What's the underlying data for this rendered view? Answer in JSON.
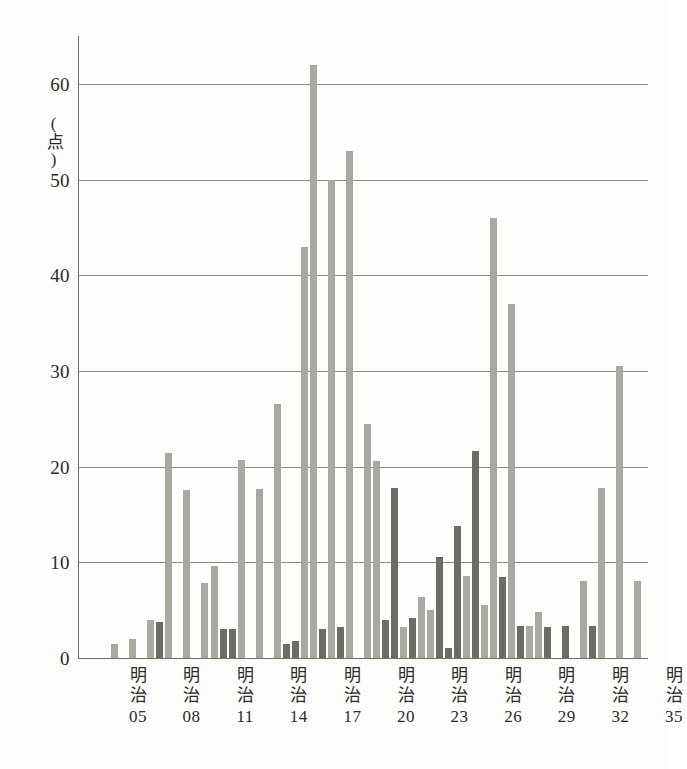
{
  "chart_data": {
    "type": "bar",
    "title": "",
    "subtitle": "",
    "xlabel": "",
    "ylabel": "",
    "yunit": "(点)",
    "ylim": [
      0,
      62
    ],
    "grid": true,
    "gridlines": [
      10,
      20,
      30,
      40,
      50,
      60
    ],
    "legend_position": "none",
    "colors": {
      "light": "#a9a9a2",
      "dark": "#6d6d66",
      "axis": "#6f6f68",
      "grid": "#8d8d85"
    },
    "y_ticks": [
      "0",
      "10",
      "20",
      "30",
      "40",
      "50",
      "60"
    ],
    "y_tick_values": [
      0,
      10,
      20,
      30,
      40,
      50,
      60
    ],
    "x_tick_labels": [
      {
        "era": "明治",
        "year": "05"
      },
      {
        "era": "明治",
        "year": "08"
      },
      {
        "era": "明治",
        "year": "11"
      },
      {
        "era": "明治",
        "year": "14"
      },
      {
        "era": "明治",
        "year": "17"
      },
      {
        "era": "明治",
        "year": "20"
      },
      {
        "era": "明治",
        "year": "23"
      },
      {
        "era": "明治",
        "year": "26"
      },
      {
        "era": "明治",
        "year": "29"
      },
      {
        "era": "明治",
        "year": "32"
      },
      {
        "era": "明治",
        "year": "35"
      }
    ],
    "x_tick_year_numbers": [
      5,
      8,
      11,
      14,
      17,
      20,
      23,
      26,
      29,
      32,
      35
    ],
    "categories": [
      "明治03",
      "明治04",
      "明治05",
      "明治06",
      "明治07",
      "明治08",
      "明治09",
      "明治10",
      "明治11",
      "明治12",
      "明治13",
      "明治14",
      "明治15",
      "明治16",
      "明治17",
      "明治18",
      "明治19",
      "明治20",
      "明治21",
      "明治22",
      "明治23",
      "明治24",
      "明治25",
      "明治26",
      "明治27",
      "明治28",
      "明治29",
      "明治30",
      "明治31",
      "明治32",
      "明治33",
      "明治34",
      "明治35",
      "明治36"
    ],
    "values": [
      1.5,
      0,
      2.0,
      4.0,
      3.8,
      21.4,
      17.6,
      7.8,
      9.6,
      3.0,
      3.0,
      20.7,
      17.7,
      26.5,
      43.0,
      62.0,
      50.0,
      53.0,
      24.5,
      20.6,
      17.8,
      3.2,
      6.4,
      5.0,
      10.6,
      13.8,
      21.6,
      5.5,
      8.5,
      46.0,
      37.0,
      3.3,
      4.8,
      3.2
    ],
    "bar_shades": [
      "light",
      "light",
      "light",
      "dark",
      "light",
      "light",
      "light",
      "light",
      "light",
      "dark",
      "dark",
      "light",
      "light",
      "light",
      "light",
      "light",
      "light",
      "light",
      "light",
      "light",
      "dark",
      "light",
      "light",
      "light",
      "dark",
      "dark",
      "dark",
      "dark",
      "dark",
      "light",
      "light",
      "dark",
      "light",
      "dark"
    ],
    "bars": [
      {
        "label": "明治03",
        "value": 1.5,
        "shade": "light",
        "x": 33
      },
      {
        "label": "明治04",
        "value": 2.0,
        "shade": "light",
        "x": 51
      },
      {
        "label": "明治05",
        "value": 4.0,
        "shade": "light",
        "x": 69
      },
      {
        "label": "明治06",
        "value": 3.8,
        "shade": "dark",
        "x": 78
      },
      {
        "label": "明治07",
        "value": 21.4,
        "shade": "light",
        "x": 87
      },
      {
        "label": "明治08",
        "value": 17.6,
        "shade": "light",
        "x": 105
      },
      {
        "label": "明治09",
        "value": 7.8,
        "shade": "light",
        "x": 123
      },
      {
        "label": "明治10",
        "value": 9.6,
        "shade": "light",
        "x": 133
      },
      {
        "label": "明治11",
        "value": 3.0,
        "shade": "dark",
        "x": 142
      },
      {
        "label": "明治12",
        "value": 3.0,
        "shade": "dark",
        "x": 151
      },
      {
        "label": "明治13",
        "value": 20.7,
        "shade": "light",
        "x": 160
      },
      {
        "label": "明治14",
        "value": 17.7,
        "shade": "light",
        "x": 178
      },
      {
        "label": "明治15",
        "value": 26.5,
        "shade": "light",
        "x": 196
      },
      {
        "label": "明治16",
        "value": 1.5,
        "shade": "dark",
        "x": 205
      },
      {
        "label": "明治17",
        "value": 1.8,
        "shade": "dark",
        "x": 214
      },
      {
        "label": "明治18",
        "value": 43.0,
        "shade": "light",
        "x": 223
      },
      {
        "label": "明治19",
        "value": 62.0,
        "shade": "light",
        "x": 232
      },
      {
        "label": "明治20",
        "value": 3.0,
        "shade": "dark",
        "x": 241
      },
      {
        "label": "明治21",
        "value": 50.0,
        "shade": "light",
        "x": 250
      },
      {
        "label": "明治22",
        "value": 3.2,
        "shade": "dark",
        "x": 259
      },
      {
        "label": "明治23",
        "value": 53.0,
        "shade": "light",
        "x": 268
      },
      {
        "label": "明治24",
        "value": 24.5,
        "shade": "light",
        "x": 286
      },
      {
        "label": "明治25",
        "value": 20.6,
        "shade": "light",
        "x": 295
      },
      {
        "label": "明治26",
        "value": 4.0,
        "shade": "dark",
        "x": 304
      },
      {
        "label": "明治27",
        "value": 17.8,
        "shade": "dark",
        "x": 313
      },
      {
        "label": "明治28",
        "value": 3.2,
        "shade": "light",
        "x": 322
      },
      {
        "label": "明治29",
        "value": 4.2,
        "shade": "dark",
        "x": 331
      },
      {
        "label": "明治30",
        "value": 6.4,
        "shade": "light",
        "x": 340
      },
      {
        "label": "明治31",
        "value": 5.0,
        "shade": "light",
        "x": 349
      },
      {
        "label": "明治32",
        "value": 10.6,
        "shade": "dark",
        "x": 358
      },
      {
        "label": "明治33",
        "value": 1.0,
        "shade": "dark",
        "x": 367
      },
      {
        "label": "明治34",
        "value": 13.8,
        "shade": "dark",
        "x": 376
      },
      {
        "label": "明治35",
        "value": 8.6,
        "shade": "light",
        "x": 385
      },
      {
        "label": "明治36",
        "value": 21.6,
        "shade": "dark",
        "x": 394
      },
      {
        "label": "明治37",
        "value": 5.5,
        "shade": "light",
        "x": 403
      },
      {
        "label": "明治38",
        "value": 46.0,
        "shade": "light",
        "x": 412
      },
      {
        "label": "明治39",
        "value": 8.5,
        "shade": "dark",
        "x": 421
      },
      {
        "label": "明治40",
        "value": 37.0,
        "shade": "light",
        "x": 430
      },
      {
        "label": "明治41",
        "value": 3.3,
        "shade": "dark",
        "x": 439
      },
      {
        "label": "明治42",
        "value": 3.3,
        "shade": "light",
        "x": 448
      },
      {
        "label": "明治43",
        "value": 4.8,
        "shade": "light",
        "x": 457
      },
      {
        "label": "明治44",
        "value": 3.2,
        "shade": "dark",
        "x": 466
      },
      {
        "label": "明治45",
        "value": 3.3,
        "shade": "dark",
        "x": 484
      },
      {
        "label": "明治46",
        "value": 8.0,
        "shade": "light",
        "x": 502
      },
      {
        "label": "明治47",
        "value": 3.3,
        "shade": "dark",
        "x": 511
      },
      {
        "label": "明治48",
        "value": 17.8,
        "shade": "light",
        "x": 520
      },
      {
        "label": "明治49",
        "value": 30.5,
        "shade": "light",
        "x": 538
      },
      {
        "label": "明治50",
        "value": 8.0,
        "shade": "light",
        "x": 556
      }
    ]
  }
}
